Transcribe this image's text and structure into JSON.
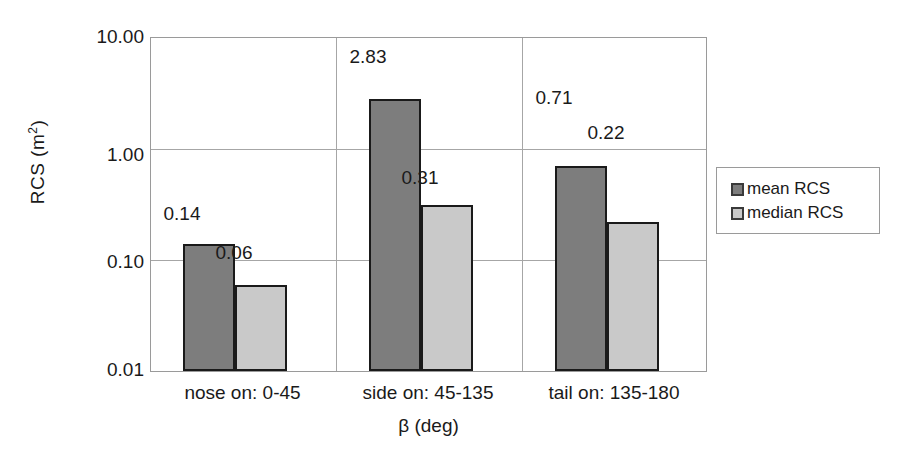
{
  "chart_data": {
    "type": "bar",
    "title": "",
    "subtitle": "",
    "xlabel": "β (deg)",
    "ylabel": "RCS (m²)",
    "ylabel_base": "RCS (m",
    "ylabel_sup": "2",
    "ylabel_close": ")",
    "yscale": "log",
    "ylim": [
      0.01,
      10.0
    ],
    "ytick_labels": [
      "10.00",
      "1.00",
      "0.10",
      "0.01"
    ],
    "ytick_values": [
      10.0,
      1.0,
      0.1,
      0.01
    ],
    "grid": "horizontal-and-category-separators",
    "legend_position": "right",
    "categories": [
      "nose on:  0-45",
      "side on: 45-135",
      "tail on: 135-180"
    ],
    "series": [
      {
        "name": "mean RCS",
        "color": "#7d7d7d",
        "values": [
          0.14,
          2.83,
          0.71
        ],
        "labels": [
          "0.14",
          "2.83",
          "0.71"
        ]
      },
      {
        "name": "median RCS",
        "color": "#c9c9c9",
        "values": [
          0.06,
          0.31,
          0.22
        ],
        "labels": [
          "0.06",
          "0.31",
          "0.22"
        ]
      }
    ]
  },
  "legend": {
    "items": [
      {
        "label": "mean RCS",
        "swatch": "mean"
      },
      {
        "label": "median RCS",
        "swatch": "median"
      }
    ]
  }
}
